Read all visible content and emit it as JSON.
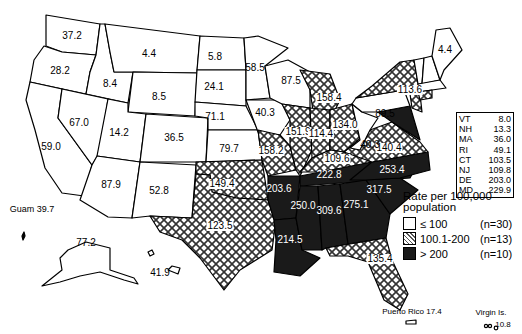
{
  "map": {
    "subject": "Rate per 100,000 population by state",
    "states": [
      {
        "state": "WA",
        "value": "37.2",
        "category": "low"
      },
      {
        "state": "OR",
        "value": "28.2",
        "category": "low"
      },
      {
        "state": "CA",
        "value": "59.0",
        "category": "low"
      },
      {
        "state": "ID",
        "value": "8.4",
        "category": "low"
      },
      {
        "state": "NV",
        "value": "67.0",
        "category": "low"
      },
      {
        "state": "MT",
        "value": "4.4",
        "category": "low"
      },
      {
        "state": "WY",
        "value": "8.5",
        "category": "low"
      },
      {
        "state": "UT",
        "value": "14.2",
        "category": "low"
      },
      {
        "state": "AZ",
        "value": "87.9",
        "category": "low"
      },
      {
        "state": "CO",
        "value": "36.5",
        "category": "low"
      },
      {
        "state": "NM",
        "value": "52.8",
        "category": "low"
      },
      {
        "state": "ND",
        "value": "5.8",
        "category": "low"
      },
      {
        "state": "SD",
        "value": "24.1",
        "category": "low"
      },
      {
        "state": "NE",
        "value": "71.1",
        "category": "low"
      },
      {
        "state": "KS",
        "value": "79.7",
        "category": "low"
      },
      {
        "state": "OK",
        "value": "149.4",
        "category": "mid"
      },
      {
        "state": "TX",
        "value": "123.5",
        "category": "mid"
      },
      {
        "state": "MN",
        "value": "58.5",
        "category": "low"
      },
      {
        "state": "IA",
        "value": "40.3",
        "category": "low"
      },
      {
        "state": "MO",
        "value": "158.2",
        "category": "mid"
      },
      {
        "state": "AR",
        "value": "203.6",
        "category": "high"
      },
      {
        "state": "LA",
        "value": "214.5",
        "category": "high"
      },
      {
        "state": "WI",
        "value": "87.5",
        "category": "low"
      },
      {
        "state": "IL",
        "value": "151.9",
        "category": "mid"
      },
      {
        "state": "MI",
        "value": "158.4",
        "category": "mid"
      },
      {
        "state": "IN",
        "value": "114.4",
        "category": "mid"
      },
      {
        "state": "OH",
        "value": "134.0",
        "category": "mid"
      },
      {
        "state": "KY",
        "value": "109.6",
        "category": "mid"
      },
      {
        "state": "TN",
        "value": "222.8",
        "category": "high"
      },
      {
        "state": "MS",
        "value": "250.0",
        "category": "high"
      },
      {
        "state": "AL",
        "value": "309.6",
        "category": "high"
      },
      {
        "state": "GA",
        "value": "275.1",
        "category": "high"
      },
      {
        "state": "FL",
        "value": "135.4",
        "category": "mid"
      },
      {
        "state": "SC",
        "value": "317.5",
        "category": "high"
      },
      {
        "state": "NC",
        "value": "253.4",
        "category": "high"
      },
      {
        "state": "VA",
        "value": "140.4",
        "category": "mid"
      },
      {
        "state": "WV",
        "value": "40.3",
        "category": "low"
      },
      {
        "state": "PA",
        "value": "89.5",
        "category": "low"
      },
      {
        "state": "NY",
        "value": "113.6",
        "category": "mid"
      },
      {
        "state": "ME",
        "value": "4.4",
        "category": "low"
      },
      {
        "state": "AK",
        "value": "77.2",
        "category": "low"
      },
      {
        "state": "HI",
        "value": "41.9",
        "category": "low"
      }
    ],
    "territories": {
      "guam": "Guam 39.7",
      "puerto_rico": "Puerto Rico 17.4",
      "virgin_islands_label": "Virgin Is.",
      "virgin_islands_value": "10.8"
    },
    "small_states": [
      {
        "abbr": "VT",
        "value": "8.0"
      },
      {
        "abbr": "NH",
        "value": "13.3"
      },
      {
        "abbr": "MA",
        "value": "36.0"
      },
      {
        "abbr": "RI",
        "value": "49.1"
      },
      {
        "abbr": "CT",
        "value": "103.5"
      },
      {
        "abbr": "NJ",
        "value": "109.8"
      },
      {
        "abbr": "DE",
        "value": "203.0"
      },
      {
        "abbr": "MD",
        "value": "229.9"
      }
    ],
    "legend": {
      "title_line1": "Rate per 100,000",
      "title_line2": "population",
      "items": [
        {
          "range": "≤ 100",
          "count": "(n=30)",
          "swatch": "white"
        },
        {
          "range": "100.1-200",
          "count": "(n=13)",
          "swatch": "crosshatch"
        },
        {
          "range": "> 200",
          "count": "(n=10)",
          "swatch": "black"
        }
      ]
    },
    "colors": {
      "low": "#ffffff",
      "mid": "crosshatch",
      "high": "#1a1a1a"
    }
  }
}
